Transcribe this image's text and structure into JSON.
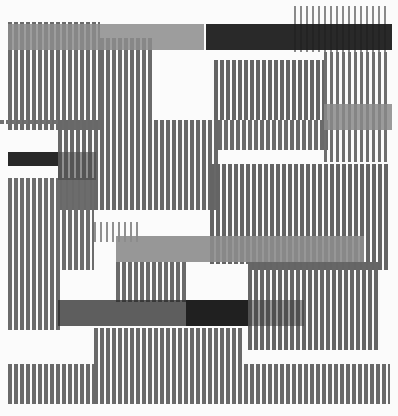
{
  "artwork": {
    "width": 398,
    "height": 416,
    "background": "#fbfbfb",
    "stripe_regions": [
      {
        "x": 8,
        "y": 22,
        "w": 92,
        "h": 108,
        "pitch": 6,
        "bar": 4,
        "color": "#6a6a6a"
      },
      {
        "x": 100,
        "y": 38,
        "w": 52,
        "h": 92,
        "pitch": 6,
        "bar": 4,
        "color": "#6a6a6a"
      },
      {
        "x": 294,
        "y": 6,
        "w": 96,
        "h": 46,
        "pitch": 6,
        "bar": 2,
        "color": "#8a8a8a"
      },
      {
        "x": 214,
        "y": 60,
        "w": 110,
        "h": 60,
        "pitch": 6,
        "bar": 4,
        "color": "#646464"
      },
      {
        "x": 324,
        "y": 52,
        "w": 66,
        "h": 110,
        "pitch": 6,
        "bar": 3,
        "color": "#6e6e6e"
      },
      {
        "x": 0,
        "y": 120,
        "w": 58,
        "h": 4,
        "pitch": 6,
        "bar": 4,
        "color": "#707070"
      },
      {
        "x": 58,
        "y": 120,
        "w": 160,
        "h": 90,
        "pitch": 6,
        "bar": 4,
        "color": "#686868"
      },
      {
        "x": 218,
        "y": 120,
        "w": 110,
        "h": 30,
        "pitch": 6,
        "bar": 4,
        "color": "#6a6a6a"
      },
      {
        "x": 210,
        "y": 164,
        "w": 180,
        "h": 106,
        "pitch": 6,
        "bar": 4,
        "color": "#646464"
      },
      {
        "x": 8,
        "y": 178,
        "w": 86,
        "h": 92,
        "pitch": 6,
        "bar": 4,
        "color": "#6c6c6c"
      },
      {
        "x": 94,
        "y": 222,
        "w": 44,
        "h": 20,
        "pitch": 6,
        "bar": 2,
        "color": "#909090"
      },
      {
        "x": 8,
        "y": 270,
        "w": 52,
        "h": 60,
        "pitch": 6,
        "bar": 4,
        "color": "#6a6a6a"
      },
      {
        "x": 116,
        "y": 262,
        "w": 70,
        "h": 40,
        "pitch": 6,
        "bar": 4,
        "color": "#6a6a6a"
      },
      {
        "x": 248,
        "y": 262,
        "w": 130,
        "h": 88,
        "pitch": 6,
        "bar": 4,
        "color": "#666666"
      },
      {
        "x": 94,
        "y": 328,
        "w": 150,
        "h": 76,
        "pitch": 6,
        "bar": 4,
        "color": "#696969"
      },
      {
        "x": 8,
        "y": 364,
        "w": 86,
        "h": 40,
        "pitch": 6,
        "bar": 4,
        "color": "#6a6a6a"
      },
      {
        "x": 244,
        "y": 364,
        "w": 146,
        "h": 40,
        "pitch": 6,
        "bar": 4,
        "color": "#696969"
      }
    ],
    "bars": [
      {
        "name": "top-gray-bar",
        "x": 8,
        "y": 24,
        "w": 196,
        "h": 26,
        "color": "#8c8c8c",
        "opacity": 0.85
      },
      {
        "name": "top-black-bar",
        "x": 206,
        "y": 24,
        "w": 186,
        "h": 26,
        "color": "#1e1e1e",
        "opacity": 0.95
      },
      {
        "name": "right-gray-block",
        "x": 324,
        "y": 104,
        "w": 68,
        "h": 26,
        "color": "#8a8a8a",
        "opacity": 0.85
      },
      {
        "name": "left-black-block",
        "x": 8,
        "y": 152,
        "w": 50,
        "h": 14,
        "color": "#1c1c1c",
        "opacity": 0.95
      },
      {
        "name": "left-dark-block",
        "x": 58,
        "y": 152,
        "w": 38,
        "h": 28,
        "color": "#4a4a4a",
        "opacity": 0.6
      },
      {
        "name": "mid-gray-bar",
        "x": 116,
        "y": 236,
        "w": 248,
        "h": 26,
        "color": "#8c8c8c",
        "opacity": 0.9
      },
      {
        "name": "mid-white-gap",
        "x": 186,
        "y": 264,
        "w": 62,
        "h": 36,
        "color": "#fbfbfb",
        "opacity": 1
      },
      {
        "name": "lower-black-bar",
        "x": 58,
        "y": 300,
        "w": 128,
        "h": 26,
        "color": "#2a2a2a",
        "opacity": 0.75
      },
      {
        "name": "lower-black-center",
        "x": 186,
        "y": 300,
        "w": 62,
        "h": 26,
        "color": "#141414",
        "opacity": 0.95
      },
      {
        "name": "lower-gray-right",
        "x": 248,
        "y": 300,
        "w": 56,
        "h": 26,
        "color": "#3a3a3a",
        "opacity": 0.5
      }
    ],
    "white_gaps": [
      {
        "x": 152,
        "y": 52,
        "w": 62,
        "h": 68
      },
      {
        "x": 0,
        "y": 130,
        "w": 58,
        "h": 22
      },
      {
        "x": 94,
        "y": 210,
        "w": 116,
        "h": 12
      },
      {
        "x": 0,
        "y": 330,
        "w": 94,
        "h": 34
      }
    ]
  }
}
